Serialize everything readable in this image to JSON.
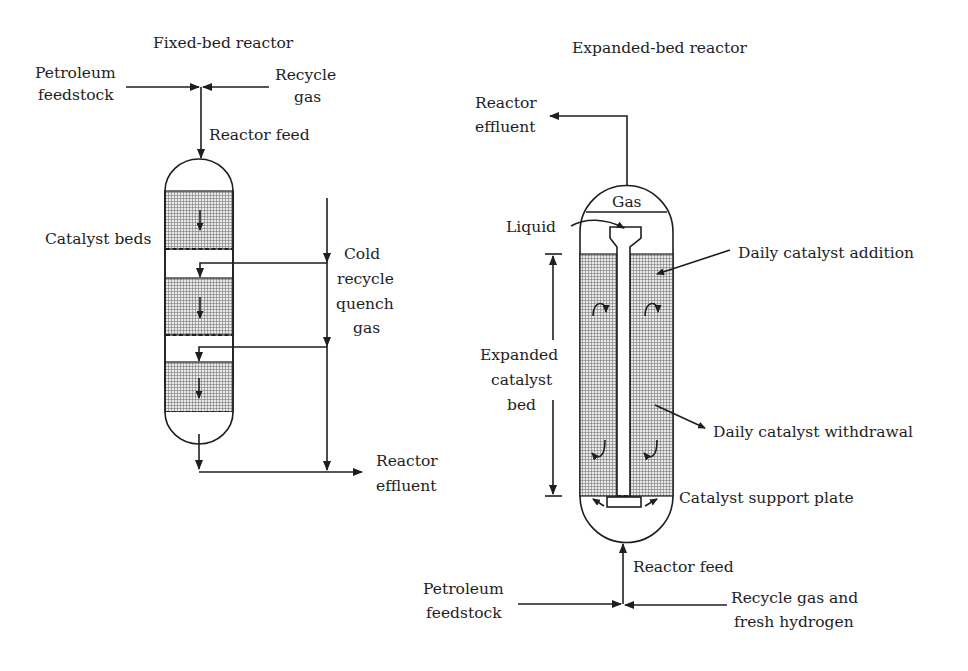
{
  "figure": {
    "fixed_bed": {
      "title": "Fixed-bed reactor",
      "petroleum_feedstock": [
        "Petroleum",
        "feedstock"
      ],
      "recycle_gas": [
        "Recycle",
        "gas"
      ],
      "reactor_feed": "Reactor feed",
      "catalyst_beds": "Catalyst beds",
      "quench_gas": [
        "Cold",
        "recycle",
        "quench",
        "gas"
      ],
      "reactor_effluent": [
        "Reactor",
        "effluent"
      ],
      "bed_count": 3
    },
    "expanded_bed": {
      "title": "Expanded-bed reactor",
      "reactor_effluent": [
        "Reactor",
        "effluent"
      ],
      "gas": "Gas",
      "liquid": "Liquid",
      "daily_catalyst_addition": "Daily catalyst addition",
      "expanded_catalyst_bed": [
        "Expanded",
        "catalyst",
        "bed"
      ],
      "daily_catalyst_withdrawal": "Daily catalyst withdrawal",
      "catalyst_support_plate": "Catalyst support plate",
      "reactor_feed": "Reactor feed",
      "petroleum_feedstock": [
        "Petroleum",
        "feedstock"
      ],
      "recycle_gas_hydrogen": [
        "Recycle gas and",
        "fresh hydrogen"
      ]
    },
    "colors": {
      "line": "#1e1e1e",
      "background": "#ffffff",
      "bed_fill": "#bdbdbd"
    }
  }
}
